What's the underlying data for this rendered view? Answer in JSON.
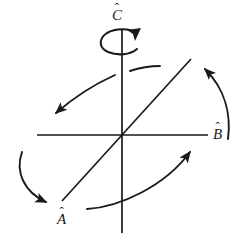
{
  "figure": {
    "type": "vector-axes-diagram",
    "background_color": "#ffffff",
    "stroke_color": "#1a1a1a",
    "width": 242,
    "height": 243,
    "axes": [
      {
        "id": "a-axis",
        "label": "A",
        "accent": "̂",
        "label_text": "Â",
        "orientation": "diagonal-lower-left-to-upper-right",
        "start": [
          62,
          201
        ],
        "end": [
          191,
          59
        ]
      },
      {
        "id": "b-axis",
        "label": "B",
        "accent": "̂",
        "label_text": "B̂",
        "orientation": "horizontal",
        "start": [
          37,
          135
        ],
        "end": [
          208,
          135
        ]
      },
      {
        "id": "c-axis",
        "label": "C",
        "accent": "̂",
        "label_text": "Ĉ",
        "orientation": "vertical",
        "start": [
          122,
          30
        ],
        "end": [
          122,
          233
        ]
      }
    ],
    "origin": [
      122,
      135
    ],
    "spin_arrow": {
      "id": "c-axis-spin-arrow",
      "description": "counter-clockwise-circular-arrow-around-c-axis",
      "center": [
        122,
        40
      ],
      "radius_x": 17,
      "radius_y": 11,
      "arrowhead_at": [
        136,
        33
      ]
    },
    "rotation_arrows": [
      {
        "id": "upper-left-rotation-arrow",
        "description": "curved-arrow-pointing-down-left",
        "start": [
          160,
          66
        ],
        "end": [
          52,
          116
        ],
        "arrowhead_at": [
          52,
          116
        ]
      },
      {
        "id": "upper-right-rotation-arrow",
        "description": "curved-arrow-pointing-up-left",
        "start": [
          228,
          139
        ],
        "end": [
          196,
          64
        ],
        "arrowhead_at": [
          196,
          64
        ]
      },
      {
        "id": "lower-left-rotation-arrow",
        "description": "curved-arrow-pointing-down-right",
        "start": [
          22,
          152
        ],
        "end": [
          53,
          205
        ],
        "arrowhead_at": [
          53,
          205
        ]
      },
      {
        "id": "lower-right-rotation-arrow",
        "description": "curved-arrow-pointing-up-right",
        "start": [
          87,
          209
        ],
        "end": [
          196,
          147
        ],
        "arrowhead_at": [
          196,
          147
        ]
      }
    ]
  },
  "labels": {
    "a": {
      "glyph": "A",
      "hat": "ˆ"
    },
    "b": {
      "glyph": "B",
      "hat": "ˆ"
    },
    "c": {
      "glyph": "C",
      "hat": "ˆ"
    }
  }
}
